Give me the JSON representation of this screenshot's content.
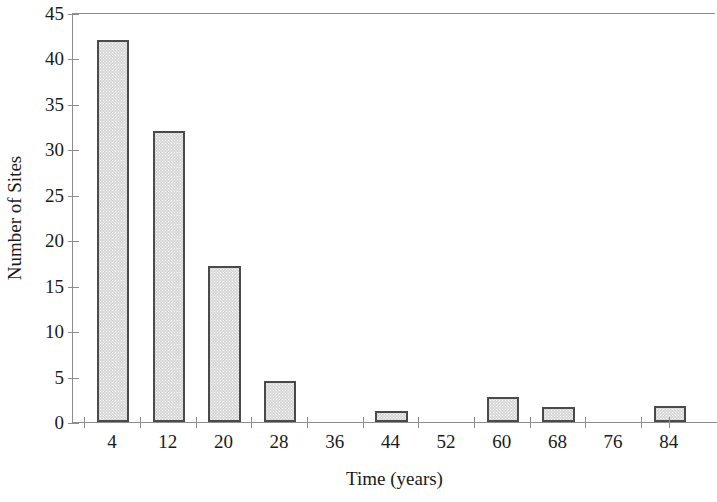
{
  "chart_data": {
    "type": "bar",
    "title": "",
    "subtitle": "",
    "xlabel": "Time (years)",
    "ylabel": "Number of Sites",
    "categories": [
      "4",
      "12",
      "20",
      "28",
      "36",
      "44",
      "52",
      "60",
      "68",
      "76",
      "84"
    ],
    "values": [
      42,
      32,
      17.2,
      4.5,
      0,
      1.2,
      0,
      2.8,
      1.6,
      0,
      1.8
    ],
    "xlim": [
      0,
      88
    ],
    "ylim": [
      0,
      45
    ],
    "bin_width": 8,
    "y_ticks": [
      0,
      5,
      10,
      15,
      20,
      25,
      30,
      35,
      40,
      45
    ],
    "y_ticklabels": [
      "0",
      "5",
      "10",
      "15",
      "20",
      "25",
      "30",
      "35",
      "40",
      "45"
    ],
    "x_ticklabels": [
      "4",
      "12",
      "20",
      "28",
      "36",
      "44",
      "52",
      "60",
      "68",
      "76",
      "84"
    ],
    "grid": false,
    "legend": null,
    "annotations": [],
    "bar_fill_color": "#d6d6d6",
    "bar_edge_color": "#4a4a4a",
    "axis_color": "#8d8d8d",
    "background_color": "#ffffff"
  },
  "figure": {
    "y_axis_title": "Number of Sites",
    "x_axis_title": "Time (years)"
  }
}
